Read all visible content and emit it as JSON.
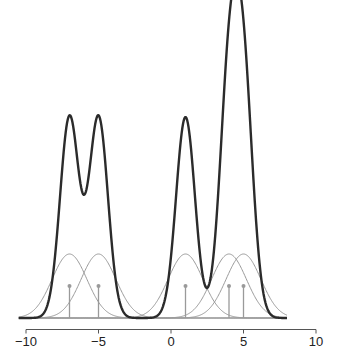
{
  "chart_data": {
    "type": "line",
    "title": "",
    "xlabel": "",
    "ylabel": "",
    "xlim": [
      -10,
      10
    ],
    "grid": false,
    "legend": null,
    "x_ticks": [
      -10,
      -5,
      0,
      5,
      10
    ],
    "x_tick_labels": [
      "−10",
      "−5",
      "0",
      "5",
      "10"
    ],
    "stems": {
      "positions": [
        -7,
        -5,
        1,
        4,
        5
      ],
      "height": 0.5,
      "color": "#9a9a9a"
    },
    "components": {
      "centers": [
        -7,
        -5,
        1,
        4,
        5
      ],
      "sigma": 1.2,
      "amplitude": 1.0,
      "color": "#9a9a9a"
    },
    "composite": {
      "centers": [
        -7,
        -5,
        1,
        4,
        5
      ],
      "sigma": 0.65,
      "amplitudes": [
        3.14,
        3.14,
        3.14,
        3.56,
        3.56
      ],
      "color": "#2b2b2b",
      "peak_values": [
        {
          "x": -7,
          "y": 3.17
        },
        {
          "x": -5,
          "y": 3.17
        },
        {
          "x": 1,
          "y": 3.14
        },
        {
          "x": 4.6,
          "y": 4.66
        }
      ],
      "local_minima": [
        {
          "x": -6,
          "y": 1.84
        },
        {
          "x": 2.5,
          "y": 0.4
        }
      ]
    },
    "curve_range": [
      -10.5,
      8
    ]
  },
  "colors": {
    "axis": "#555555",
    "baseline": "#b0b0b0",
    "background": "#ffffff"
  }
}
